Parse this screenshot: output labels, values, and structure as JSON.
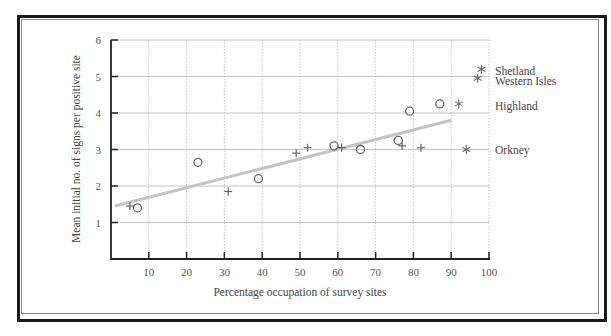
{
  "chart_data": {
    "type": "scatter",
    "title": "",
    "xlabel": "Percentage occupation of survey sites",
    "ylabel": "Mean initial no. of signs per positive site",
    "xlim": [
      0,
      100
    ],
    "ylim": [
      0,
      6
    ],
    "x_ticks": [
      10,
      20,
      30,
      40,
      50,
      60,
      70,
      80,
      90,
      100
    ],
    "y_ticks": [
      1,
      2,
      3,
      4,
      5,
      6
    ],
    "grid": true,
    "series": [
      {
        "name": "circles",
        "marker": "circle",
        "points": [
          {
            "x": 7,
            "y": 1.4
          },
          {
            "x": 23,
            "y": 2.65
          },
          {
            "x": 39,
            "y": 2.2
          },
          {
            "x": 59,
            "y": 3.1
          },
          {
            "x": 66,
            "y": 3.0
          },
          {
            "x": 76,
            "y": 3.25
          },
          {
            "x": 79,
            "y": 4.05
          },
          {
            "x": 87,
            "y": 4.25
          }
        ]
      },
      {
        "name": "crosses",
        "marker": "plus",
        "points": [
          {
            "x": 5,
            "y": 1.45
          },
          {
            "x": 31,
            "y": 1.85
          },
          {
            "x": 49,
            "y": 2.9
          },
          {
            "x": 52,
            "y": 3.05
          },
          {
            "x": 61,
            "y": 3.05
          },
          {
            "x": 77,
            "y": 3.1
          },
          {
            "x": 82,
            "y": 3.05
          }
        ]
      },
      {
        "name": "regional totals",
        "marker": "asterisk",
        "points": [
          {
            "x": 98,
            "y": 5.2,
            "label": "Shetland"
          },
          {
            "x": 97,
            "y": 4.95,
            "label": "Western Isles"
          },
          {
            "x": 92,
            "y": 4.25,
            "label": "Highland"
          },
          {
            "x": 94,
            "y": 3.0,
            "label": "Orkney"
          }
        ]
      }
    ],
    "trendline": {
      "x1": 1,
      "y1": 1.45,
      "x2": 90,
      "y2": 3.8,
      "color": "#c4c4c4"
    },
    "region_labels": [
      {
        "text": "Shetland",
        "y": 5.15
      },
      {
        "text": "Western Isles",
        "y": 4.88
      },
      {
        "text": "Highland",
        "y": 4.2
      },
      {
        "text": "Orkney",
        "y": 3.0
      }
    ]
  },
  "colors": {
    "marker": "#666666",
    "axis": "#222222",
    "grid": "#b5b5b5",
    "frame": "#1a1a1a"
  }
}
